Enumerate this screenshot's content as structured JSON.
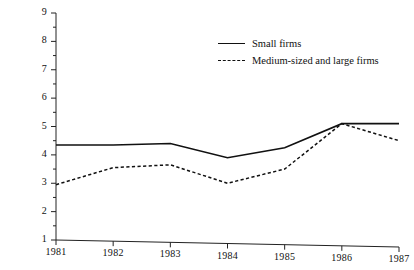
{
  "chart_data": {
    "type": "line",
    "title": "",
    "xlabel": "",
    "ylabel": "",
    "x": [
      1981,
      1982,
      1983,
      1984,
      1985,
      1986,
      1987
    ],
    "categories": [
      "1981",
      "1982",
      "1983",
      "1984",
      "1985",
      "1986",
      "1987"
    ],
    "xlim": [
      1981,
      1987
    ],
    "ylim": [
      1,
      9
    ],
    "y_ticks": [
      1,
      2,
      3,
      4,
      5,
      6,
      7,
      8,
      9
    ],
    "y_minor_tick_step": 0.5,
    "grid": false,
    "legend_position": "top-right",
    "series": [
      {
        "name": "Small firms",
        "style": "solid",
        "color": "#111111",
        "values": [
          4.35,
          4.35,
          4.4,
          3.9,
          4.25,
          5.1,
          5.1
        ]
      },
      {
        "name": "Medium-sized and large firms",
        "style": "dashed",
        "color": "#111111",
        "values": [
          2.95,
          3.55,
          3.65,
          3.0,
          3.5,
          5.1,
          4.5
        ]
      }
    ]
  },
  "axes": {
    "y_tick_labels": [
      "9",
      "8",
      "7",
      "6",
      "5",
      "4",
      "3",
      "2",
      "1"
    ],
    "x_tick_labels": [
      "1981",
      "1982",
      "1983",
      "1984",
      "1985",
      "1986",
      "1987"
    ]
  },
  "legend": {
    "items": [
      {
        "label": "Small firms",
        "style": "solid"
      },
      {
        "label": "Medium-sized and large firms",
        "style": "dashed"
      }
    ]
  }
}
